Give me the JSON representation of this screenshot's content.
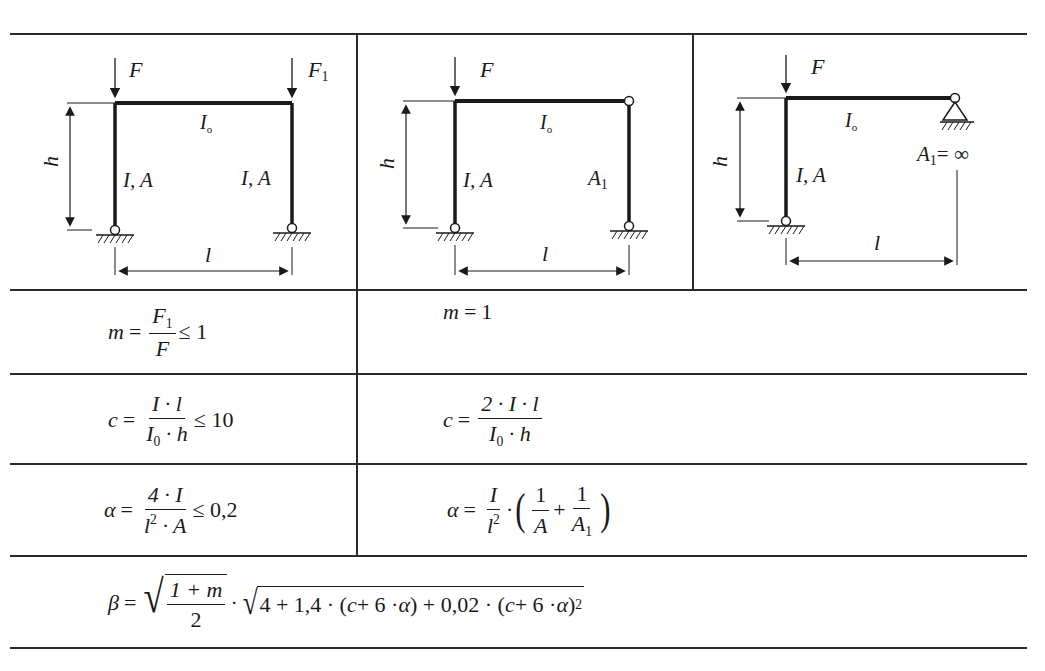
{
  "table": {
    "columns": [
      {
        "diagram": "two-hinged-frame-both-legs-loaded",
        "labels": {
          "force_left": "F",
          "force_right": "F",
          "force_right_sub": "1",
          "beam": "I",
          "beam_sub": "o",
          "leg_left": "I, A",
          "leg_right": "I, A",
          "height": "h",
          "span": "l"
        }
      },
      {
        "diagram": "frame-with-pinned-right-column",
        "labels": {
          "force_left": "F",
          "beam": "I",
          "beam_sub": "o",
          "leg_left": "I, A",
          "leg_right": "A",
          "leg_right_sub": "1",
          "height": "h",
          "span": "l"
        }
      },
      {
        "diagram": "frame-with-roller-support",
        "labels": {
          "force_left": "F",
          "beam": "I",
          "beam_sub": "o",
          "leg_left": "I, A",
          "support": "A",
          "support_sub": "1",
          "support_value": "= ∞",
          "height": "h",
          "span": "l"
        }
      }
    ],
    "rows": {
      "m": {
        "col1": {
          "lhs": "m",
          "eq": "=",
          "num": "F",
          "num_sub": "1",
          "den": "F",
          "cond": "≤ 1"
        },
        "col2": {
          "lhs": "m",
          "eq": "=",
          "rhs": "1"
        }
      },
      "c": {
        "col1": {
          "lhs": "c",
          "eq": "=",
          "num": "I · l",
          "den": "I",
          "den_sub": "0",
          "den_rest": " · h",
          "cond": "≤ 10"
        },
        "col2": {
          "lhs": "c",
          "eq": "=",
          "num": "2 · I · l",
          "den": "I",
          "den_sub": "0",
          "den_rest": " · h"
        }
      },
      "alpha": {
        "col1": {
          "lhs": "α",
          "eq": "=",
          "num": "4 · I",
          "den": "l",
          "den_sup": "2",
          "den_rest": " · A",
          "cond": "≤ 0,2"
        },
        "col2": {
          "lhs": "α",
          "eq": "=",
          "num": "I",
          "den": "l",
          "den_sup": "2",
          "dot": "·",
          "term1_num": "1",
          "term1_den": "A",
          "plus": "+",
          "term2_num": "1",
          "term2_den": "A",
          "term2_den_sub": "1"
        }
      },
      "beta": {
        "lhs": "β",
        "eq": "=",
        "sqrt1_num": "1 + m",
        "sqrt1_den": "2",
        "dot": "·",
        "sqrt2_a": "4 + 1,4 · (",
        "sqrt2_c1": "c",
        "sqrt2_b": " + 6 · ",
        "sqrt2_alpha1": "α",
        "sqrt2_c": ") + 0,02 · (",
        "sqrt2_c2": "c",
        "sqrt2_d": " + 6 · ",
        "sqrt2_alpha2": "α",
        "sqrt2_e": ")",
        "sqrt2_sup": "2"
      }
    }
  }
}
